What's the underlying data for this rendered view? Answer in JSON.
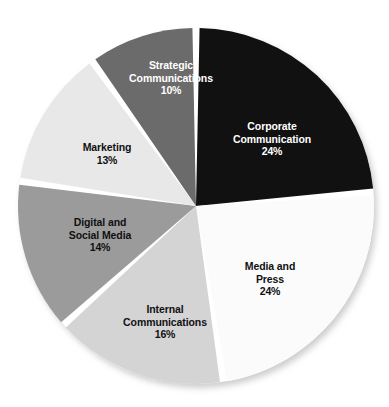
{
  "figure": {
    "background_color": "#ffffff",
    "separator_color": "#ffffff",
    "shadow_color": "#d8d8d8"
  },
  "chart_data": {
    "type": "pie",
    "title": "",
    "subtitle": "",
    "xlabel": "",
    "ylabel": "",
    "legend_position": "none",
    "grid": false,
    "labels_inside_slices": true,
    "value_suffix": "%",
    "start_angle_deg": 0,
    "direction": "clockwise",
    "total": 101,
    "categories": [
      "Corporate Communication",
      "Media and Press",
      "Internal Communications",
      "Digital and Social Media",
      "Marketing",
      "Strategic Communications"
    ],
    "values": [
      24,
      24,
      16,
      14,
      13,
      10
    ],
    "slices": [
      {
        "name": "corporate-communication",
        "label": "Corporate\nCommunication",
        "value": 24,
        "value_text": "24%",
        "color": "#111111",
        "text_color": "#ffffff",
        "start_angle_deg": 0,
        "end_angle_deg": 85.5
      },
      {
        "name": "media-and-press",
        "label": "Media and\nPress",
        "value": 24,
        "value_text": "24%",
        "color": "#fbfbfb",
        "text_color": "#111111",
        "start_angle_deg": 85.5,
        "end_angle_deg": 171.1
      },
      {
        "name": "internal-communications",
        "label": "Internal\nCommunications",
        "value": 16,
        "value_text": "16%",
        "color": "#d4d4d4",
        "text_color": "#111111",
        "start_angle_deg": 171.1,
        "end_angle_deg": 228.1
      },
      {
        "name": "digital-and-social-media",
        "label": "Digital and\nSocial Media",
        "value": 14,
        "value_text": "14%",
        "color": "#9b9b9b",
        "text_color": "#111111",
        "start_angle_deg": 228.1,
        "end_angle_deg": 278.0
      },
      {
        "name": "marketing",
        "label": "Marketing",
        "value": 13,
        "value_text": "13%",
        "color": "#e8e8e8",
        "text_color": "#111111",
        "start_angle_deg": 278.0,
        "end_angle_deg": 324.4
      },
      {
        "name": "strategic-communications",
        "label": "Strategic\nCommunications",
        "value": 10,
        "value_text": "10%",
        "color": "#6b6b6b",
        "text_color": "#ffffff",
        "start_angle_deg": 324.4,
        "end_angle_deg": 360
      }
    ]
  }
}
